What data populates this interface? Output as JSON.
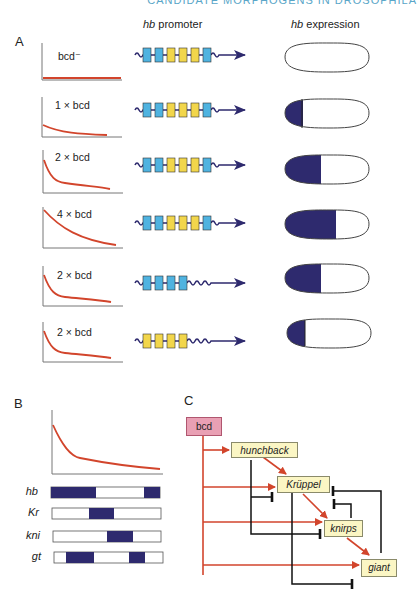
{
  "header": {
    "cut_text": "CANDIDATE MORPHOGENS IN DROSOPHILA"
  },
  "panel_a": {
    "label": "A",
    "col_promoter_italic": "hb",
    "col_promoter_rest": " promoter",
    "col_expression_italic": "hb",
    "col_expression_rest": " expression",
    "rows": [
      {
        "dose_label": "bcd⁻",
        "gradient": "none",
        "sites": [
          "blue",
          "blue",
          "yellow",
          "yellow",
          "yellow",
          "blue"
        ],
        "expression_fraction": 0.0
      },
      {
        "dose_label": "1 × bcd",
        "gradient": "low",
        "sites": [
          "blue",
          "blue",
          "yellow",
          "yellow",
          "yellow",
          "blue"
        ],
        "expression_fraction": 0.21
      },
      {
        "dose_label": "2 × bcd",
        "gradient": "medium",
        "sites": [
          "blue",
          "blue",
          "yellow",
          "yellow",
          "yellow",
          "blue"
        ],
        "expression_fraction": 0.42
      },
      {
        "dose_label": "4 × bcd",
        "gradient": "high",
        "sites": [
          "blue",
          "blue",
          "yellow",
          "yellow",
          "yellow",
          "blue"
        ],
        "expression_fraction": 0.6
      },
      {
        "dose_label": "2 × bcd",
        "gradient": "medium",
        "sites": [
          "blue",
          "blue",
          "blue",
          "blue"
        ],
        "expression_fraction": 0.42
      },
      {
        "dose_label": "2 × bcd",
        "gradient": "medium",
        "sites": [
          "yellow",
          "yellow",
          "yellow",
          "yellow"
        ],
        "expression_fraction": 0.21
      }
    ]
  },
  "panel_b": {
    "label": "B",
    "genes": [
      {
        "name": "hb",
        "domains": [
          [
            0,
            0.41
          ],
          [
            0.85,
            1.0
          ]
        ]
      },
      {
        "name": "Kr",
        "domains": [
          [
            0.34,
            0.57
          ]
        ]
      },
      {
        "name": "kni",
        "domains": [
          [
            0.5,
            0.73
          ]
        ]
      },
      {
        "name": "gt",
        "domains": [
          [
            0.1,
            0.36
          ],
          [
            0.69,
            0.83
          ]
        ]
      }
    ]
  },
  "panel_c": {
    "label": "C",
    "nodes": {
      "bcd": "bcd",
      "hunchback": "hunchback",
      "kruppel": "Krüppel",
      "knirps": "knirps",
      "giant": "giant"
    },
    "activations": [
      [
        "bcd",
        "hunchback"
      ],
      [
        "bcd",
        "kruppel"
      ],
      [
        "bcd",
        "knirps"
      ],
      [
        "bcd",
        "giant"
      ],
      [
        "hunchback",
        "kruppel"
      ],
      [
        "kruppel",
        "knirps"
      ],
      [
        "knirps",
        "giant"
      ]
    ],
    "repressions": [
      [
        "hunchback",
        "kruppel"
      ],
      [
        "hunchback",
        "knirps"
      ],
      [
        "kruppel",
        "giant"
      ],
      [
        "knirps",
        "kruppel"
      ],
      [
        "giant",
        "kruppel"
      ]
    ]
  },
  "colors": {
    "gradient_red": "#d2452c",
    "activation_red": "#d2452c",
    "expression_navy": "#2e2a6e",
    "site_blue": "#4fb3e0",
    "site_yellow": "#f2d64b",
    "node_yellow": "#fbf6c4",
    "node_pink": "#e9a0b4"
  }
}
